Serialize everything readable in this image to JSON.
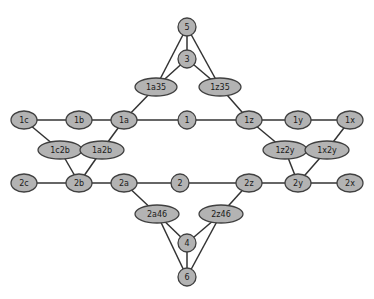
{
  "diagram": {
    "background_color": "#ffffff",
    "node_fill_color": "#b3b3b3",
    "node_stroke_color": "#404040",
    "edge_color": "#333333",
    "label_color": "#1a1a1a"
  },
  "nodes": [
    {
      "id": "5",
      "label": "5",
      "x": 187,
      "y": 27,
      "shape": "circle",
      "rx": 9,
      "ry": 9
    },
    {
      "id": "3",
      "label": "3",
      "x": 187,
      "y": 59,
      "shape": "circle",
      "rx": 9,
      "ry": 9
    },
    {
      "id": "1a35",
      "label": "1a35",
      "x": 156,
      "y": 87,
      "shape": "ellipse",
      "rx": 21,
      "ry": 9
    },
    {
      "id": "1z35",
      "label": "1z35",
      "x": 220,
      "y": 87,
      "shape": "ellipse",
      "rx": 21,
      "ry": 9
    },
    {
      "id": "1c",
      "label": "1c",
      "x": 24,
      "y": 120,
      "shape": "ellipse",
      "rx": 13,
      "ry": 9
    },
    {
      "id": "1b",
      "label": "1b",
      "x": 79,
      "y": 120,
      "shape": "ellipse",
      "rx": 13,
      "ry": 9
    },
    {
      "id": "1a",
      "label": "1a",
      "x": 124,
      "y": 120,
      "shape": "ellipse",
      "rx": 13,
      "ry": 9
    },
    {
      "id": "1",
      "label": "1",
      "x": 187,
      "y": 120,
      "shape": "circle",
      "rx": 9,
      "ry": 9
    },
    {
      "id": "1z",
      "label": "1z",
      "x": 249,
      "y": 120,
      "shape": "ellipse",
      "rx": 13,
      "ry": 9
    },
    {
      "id": "1y",
      "label": "1y",
      "x": 298,
      "y": 120,
      "shape": "ellipse",
      "rx": 13,
      "ry": 9
    },
    {
      "id": "1x",
      "label": "1x",
      "x": 350,
      "y": 120,
      "shape": "ellipse",
      "rx": 13,
      "ry": 9
    },
    {
      "id": "1c2b",
      "label": "1c2b",
      "x": 60,
      "y": 150,
      "shape": "ellipse",
      "rx": 22,
      "ry": 9
    },
    {
      "id": "1a2b",
      "label": "1a2b",
      "x": 102,
      "y": 150,
      "shape": "ellipse",
      "rx": 22,
      "ry": 9
    },
    {
      "id": "1z2y",
      "label": "1z2y",
      "x": 285,
      "y": 150,
      "shape": "ellipse",
      "rx": 22,
      "ry": 9
    },
    {
      "id": "1x2y",
      "label": "1x2y",
      "x": 327,
      "y": 150,
      "shape": "ellipse",
      "rx": 22,
      "ry": 9
    },
    {
      "id": "2c",
      "label": "2c",
      "x": 24,
      "y": 183,
      "shape": "ellipse",
      "rx": 13,
      "ry": 9
    },
    {
      "id": "2b",
      "label": "2b",
      "x": 79,
      "y": 183,
      "shape": "ellipse",
      "rx": 13,
      "ry": 9
    },
    {
      "id": "2a",
      "label": "2a",
      "x": 124,
      "y": 183,
      "shape": "ellipse",
      "rx": 13,
      "ry": 9
    },
    {
      "id": "2",
      "label": "2",
      "x": 180,
      "y": 183,
      "shape": "circle",
      "rx": 9,
      "ry": 9
    },
    {
      "id": "2z",
      "label": "2z",
      "x": 249,
      "y": 183,
      "shape": "ellipse",
      "rx": 13,
      "ry": 9
    },
    {
      "id": "2y",
      "label": "2y",
      "x": 298,
      "y": 183,
      "shape": "ellipse",
      "rx": 13,
      "ry": 9
    },
    {
      "id": "2x",
      "label": "2x",
      "x": 350,
      "y": 183,
      "shape": "ellipse",
      "rx": 13,
      "ry": 9
    },
    {
      "id": "2a46",
      "label": "2a46",
      "x": 157,
      "y": 214,
      "shape": "ellipse",
      "rx": 22,
      "ry": 9
    },
    {
      "id": "2z46",
      "label": "2z46",
      "x": 221,
      "y": 214,
      "shape": "ellipse",
      "rx": 22,
      "ry": 9
    },
    {
      "id": "4",
      "label": "4",
      "x": 187,
      "y": 243,
      "shape": "circle",
      "rx": 9,
      "ry": 9
    },
    {
      "id": "6",
      "label": "6",
      "x": 187,
      "y": 277,
      "shape": "circle",
      "rx": 9,
      "ry": 9
    }
  ],
  "edges": [
    {
      "from": "5",
      "to": "3"
    },
    {
      "from": "5",
      "to": "1a35"
    },
    {
      "from": "5",
      "to": "1z35"
    },
    {
      "from": "3",
      "to": "1a35"
    },
    {
      "from": "3",
      "to": "1z35"
    },
    {
      "from": "1a35",
      "to": "1a"
    },
    {
      "from": "1z35",
      "to": "1z"
    },
    {
      "from": "1c",
      "to": "1b"
    },
    {
      "from": "1b",
      "to": "1a"
    },
    {
      "from": "1a",
      "to": "1"
    },
    {
      "from": "1",
      "to": "1z"
    },
    {
      "from": "1z",
      "to": "1y"
    },
    {
      "from": "1y",
      "to": "1x"
    },
    {
      "from": "1c",
      "to": "1c2b"
    },
    {
      "from": "1a",
      "to": "1a2b"
    },
    {
      "from": "1c2b",
      "to": "2b"
    },
    {
      "from": "1a2b",
      "to": "2b"
    },
    {
      "from": "1z",
      "to": "1z2y"
    },
    {
      "from": "1x",
      "to": "1x2y"
    },
    {
      "from": "1z2y",
      "to": "2y"
    },
    {
      "from": "1x2y",
      "to": "2y"
    },
    {
      "from": "2c",
      "to": "2b"
    },
    {
      "from": "2b",
      "to": "2a"
    },
    {
      "from": "2a",
      "to": "2"
    },
    {
      "from": "2",
      "to": "2z"
    },
    {
      "from": "2z",
      "to": "2y"
    },
    {
      "from": "2y",
      "to": "2x"
    },
    {
      "from": "2a",
      "to": "2a46"
    },
    {
      "from": "2z",
      "to": "2z46"
    },
    {
      "from": "2a46",
      "to": "4"
    },
    {
      "from": "2a46",
      "to": "6"
    },
    {
      "from": "2z46",
      "to": "4"
    },
    {
      "from": "2z46",
      "to": "6"
    },
    {
      "from": "4",
      "to": "6"
    }
  ]
}
